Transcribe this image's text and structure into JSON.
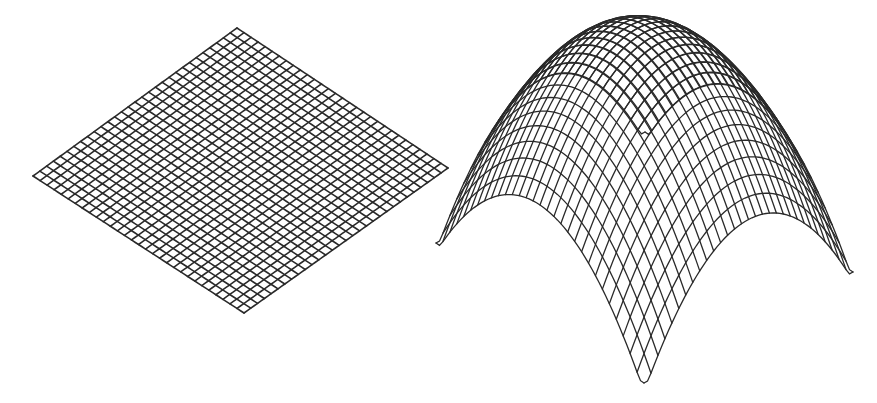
{
  "figure": {
    "background": "#ffffff",
    "stroke_color": "#2a2a2a",
    "panels": [
      {
        "name": "flat-plane",
        "surface": "plane",
        "grid_divisions": 30,
        "stroke_width": 1.6,
        "corners": {
          "top": [
            237,
            28
          ],
          "left": [
            33,
            176
          ],
          "bottom": [
            244,
            313
          ],
          "right": [
            448,
            168
          ]
        }
      },
      {
        "name": "paraboloid-dome",
        "surface": "paraboloid",
        "grid_divisions": 30,
        "stroke_width": 1.3,
        "base_corners": {
          "back": [
            645,
            132
          ],
          "left": [
            436,
            243
          ],
          "bottom": [
            644,
            383
          ],
          "right": [
            853,
            272
          ]
        },
        "height": {
          "center_lift": 225,
          "curvature": 117
        }
      }
    ]
  }
}
